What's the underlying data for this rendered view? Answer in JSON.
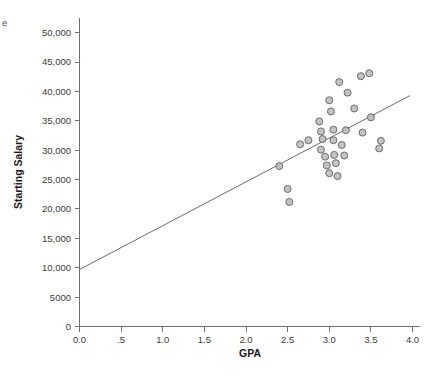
{
  "corner": {
    "clipped_text": "e"
  },
  "chart_data": {
    "type": "scatter",
    "title": "",
    "xlabel": "GPA",
    "ylabel": "Starting Salary",
    "xlim": [
      0.0,
      4.0
    ],
    "ylim": [
      0,
      52500
    ],
    "grid": false,
    "legend": null,
    "xticks": [
      0.0,
      0.5,
      1.0,
      1.5,
      2.0,
      2.5,
      3.0,
      3.5,
      4.0
    ],
    "xticklabels": [
      "0.0",
      ".5",
      "1.0",
      "1.5",
      "2.0",
      "2.5",
      "3.0",
      "3.5",
      "4.0"
    ],
    "yticks": [
      0,
      5000,
      10000,
      15000,
      20000,
      25000,
      30000,
      35000,
      40000,
      45000,
      50000
    ],
    "yticklabels": [
      "0",
      "5000",
      "10,000",
      "15,000",
      "20,000",
      "25,000",
      "30,000",
      "35,000",
      "40,000",
      "45,000",
      "50,000"
    ],
    "marker": {
      "shape": "circle",
      "size": 7,
      "fill_color": "#b8b8b8",
      "edge_color": "#6b6b6b"
    },
    "fit_line": {
      "type": "linear-regression",
      "color": "#6a6a6a",
      "x_start": 0.0,
      "y_start": 9700,
      "x_end": 3.97,
      "y_end": 39300
    },
    "points": [
      {
        "x": 2.4,
        "y": 27300
      },
      {
        "x": 2.5,
        "y": 23400
      },
      {
        "x": 2.52,
        "y": 21200
      },
      {
        "x": 2.65,
        "y": 31000
      },
      {
        "x": 2.75,
        "y": 31700
      },
      {
        "x": 2.88,
        "y": 34900
      },
      {
        "x": 2.9,
        "y": 33200
      },
      {
        "x": 2.92,
        "y": 31900
      },
      {
        "x": 2.9,
        "y": 30100
      },
      {
        "x": 2.95,
        "y": 28900
      },
      {
        "x": 2.97,
        "y": 27400
      },
      {
        "x": 3.0,
        "y": 26100
      },
      {
        "x": 3.0,
        "y": 38500
      },
      {
        "x": 3.02,
        "y": 36600
      },
      {
        "x": 3.05,
        "y": 33500
      },
      {
        "x": 3.05,
        "y": 31700
      },
      {
        "x": 3.06,
        "y": 29200
      },
      {
        "x": 3.08,
        "y": 27800
      },
      {
        "x": 3.1,
        "y": 25600
      },
      {
        "x": 3.12,
        "y": 41600
      },
      {
        "x": 3.15,
        "y": 30900
      },
      {
        "x": 3.18,
        "y": 29100
      },
      {
        "x": 3.2,
        "y": 33400
      },
      {
        "x": 3.22,
        "y": 39800
      },
      {
        "x": 3.3,
        "y": 37100
      },
      {
        "x": 3.38,
        "y": 42600
      },
      {
        "x": 3.4,
        "y": 33000
      },
      {
        "x": 3.48,
        "y": 43100
      },
      {
        "x": 3.5,
        "y": 35600
      },
      {
        "x": 3.62,
        "y": 31600
      },
      {
        "x": 3.6,
        "y": 30300
      }
    ]
  }
}
